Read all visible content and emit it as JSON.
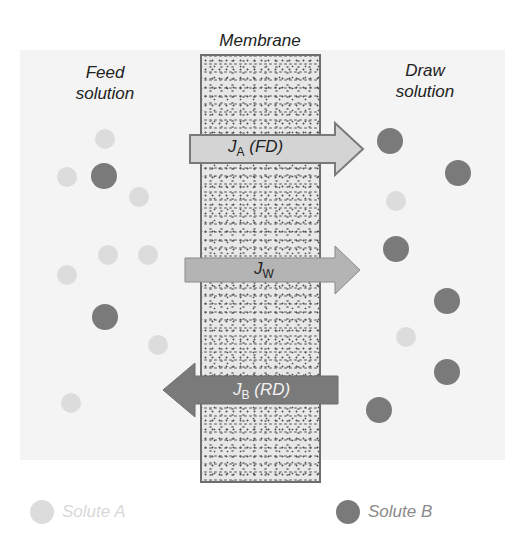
{
  "labels": {
    "membrane": "Membrane",
    "feed_line1": "Feed",
    "feed_line2": "solution",
    "draw_line1": "Draw",
    "draw_line2": "solution"
  },
  "arrows": [
    {
      "id": "JA",
      "symbol": "J",
      "subscript": "A",
      "suffix": " (FD)",
      "direction": "right",
      "meaning": "forward diffusion",
      "color": "#d4d4d4"
    },
    {
      "id": "JW",
      "symbol": "J",
      "subscript": "W",
      "suffix": "",
      "direction": "right",
      "color": "#b4b4b4"
    },
    {
      "id": "JB",
      "symbol": "J",
      "subscript": "B",
      "suffix": " (RD)",
      "direction": "left",
      "meaning": "reverse diffusion",
      "color": "#7a7a7a"
    }
  ],
  "legend": {
    "solute_a": "Solute A",
    "solute_b": "Solute B",
    "solute_a_color": "#dcdcdc",
    "solute_b_color": "#7a7a7a"
  },
  "particles": {
    "feed": [
      {
        "type": "A",
        "x": 105,
        "y": 139
      },
      {
        "type": "A",
        "x": 67,
        "y": 177
      },
      {
        "type": "B",
        "x": 104,
        "y": 176
      },
      {
        "type": "A",
        "x": 139,
        "y": 197
      },
      {
        "type": "A",
        "x": 108,
        "y": 255
      },
      {
        "type": "A",
        "x": 148,
        "y": 255
      },
      {
        "type": "A",
        "x": 67,
        "y": 275
      },
      {
        "type": "B",
        "x": 105,
        "y": 317
      },
      {
        "type": "A",
        "x": 158,
        "y": 345
      },
      {
        "type": "A",
        "x": 71,
        "y": 403
      }
    ],
    "draw": [
      {
        "type": "B",
        "x": 390,
        "y": 141
      },
      {
        "type": "B",
        "x": 458,
        "y": 173
      },
      {
        "type": "A",
        "x": 396,
        "y": 201
      },
      {
        "type": "B",
        "x": 396,
        "y": 249
      },
      {
        "type": "B",
        "x": 447,
        "y": 301
      },
      {
        "type": "A",
        "x": 406,
        "y": 337
      },
      {
        "type": "B",
        "x": 447,
        "y": 372
      },
      {
        "type": "B",
        "x": 379,
        "y": 410
      }
    ]
  }
}
